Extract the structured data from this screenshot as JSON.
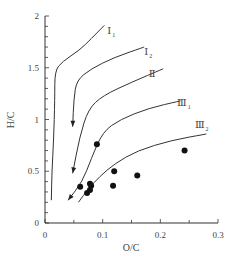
{
  "chart_data": {
    "type": "line",
    "title": "",
    "xlabel": "O/C",
    "ylabel": "H/C",
    "xlim": [
      0,
      0.3
    ],
    "ylim": [
      0,
      2
    ],
    "x_ticks": [
      "0",
      "0.1",
      "0.2",
      "0.3"
    ],
    "y_ticks": [
      "0",
      "0.5",
      "1",
      "1.5",
      "2"
    ],
    "grid": false,
    "legend": "inline labels at curve ends",
    "series": [
      {
        "name": "I1",
        "label": "Ⅰ",
        "sub": "1",
        "points": [
          [
            0.103,
            1.91
          ],
          [
            0.08,
            1.78
          ],
          [
            0.06,
            1.67
          ],
          [
            0.03,
            1.56
          ],
          [
            0.017,
            1.47
          ],
          [
            0.017,
            1.2
          ],
          [
            0.015,
            0.8
          ],
          [
            0.012,
            0.5
          ],
          [
            0.011,
            0.22
          ]
        ],
        "arrow": false,
        "label_pos": [
          0.108,
          1.83
        ]
      },
      {
        "name": "I2",
        "label": "Ⅰ",
        "sub": "2",
        "points": [
          [
            0.172,
            1.7
          ],
          [
            0.12,
            1.6
          ],
          [
            0.08,
            1.49
          ],
          [
            0.055,
            1.38
          ],
          [
            0.05,
            1.2
          ],
          [
            0.048,
            0.93
          ]
        ],
        "arrow": true,
        "label_pos": [
          0.172,
          1.62
        ]
      },
      {
        "name": "II",
        "label": "Ⅱ",
        "sub": "",
        "points": [
          [
            0.205,
            1.49
          ],
          [
            0.15,
            1.36
          ],
          [
            0.1,
            1.23
          ],
          [
            0.075,
            1.1
          ],
          [
            0.06,
            0.83
          ],
          [
            0.048,
            0.48
          ]
        ],
        "arrow": true,
        "label_pos": [
          0.18,
          1.41
        ]
      },
      {
        "name": "III1",
        "label": "Ⅲ",
        "sub": "1",
        "points": [
          [
            0.235,
            1.18
          ],
          [
            0.18,
            1.11
          ],
          [
            0.13,
            1.0
          ],
          [
            0.1,
            0.88
          ],
          [
            0.08,
            0.62
          ],
          [
            0.065,
            0.4
          ],
          [
            0.04,
            0.22
          ]
        ],
        "arrow": true,
        "label_pos": [
          0.229,
          1.13
        ]
      },
      {
        "name": "III2",
        "label": "Ⅲ",
        "sub": "2",
        "points": [
          [
            0.28,
            0.86
          ],
          [
            0.22,
            0.8
          ],
          [
            0.16,
            0.7
          ],
          [
            0.12,
            0.57
          ],
          [
            0.095,
            0.45
          ],
          [
            0.075,
            0.33
          ],
          [
            0.058,
            0.2
          ]
        ],
        "arrow": false,
        "label_pos": [
          0.26,
          0.92
        ]
      }
    ],
    "scatter": {
      "name": "samples",
      "points": [
        [
          0.061,
          0.35
        ],
        [
          0.073,
          0.29
        ],
        [
          0.078,
          0.32
        ],
        [
          0.08,
          0.36
        ],
        [
          0.078,
          0.38
        ],
        [
          0.09,
          0.76
        ],
        [
          0.118,
          0.36
        ],
        [
          0.12,
          0.5
        ],
        [
          0.16,
          0.46
        ],
        [
          0.242,
          0.7
        ]
      ]
    }
  }
}
